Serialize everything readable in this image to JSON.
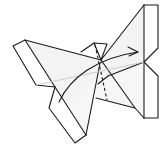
{
  "diagram": {
    "colors": {
      "line": "#1a1a1a",
      "paper_face": "#f2f2f2",
      "paper_white": "#ffffff",
      "crease": "#c8c8c8",
      "background": "#ffffff"
    },
    "annotations": [
      {
        "type": "valley-fold-line",
        "style": "dashed",
        "label": "fold line"
      },
      {
        "type": "crease",
        "style": "light gray",
        "label": "center crease"
      },
      {
        "type": "fold-arrow",
        "direction": "left-to-right curved",
        "label": "fold arrow"
      }
    ]
  }
}
